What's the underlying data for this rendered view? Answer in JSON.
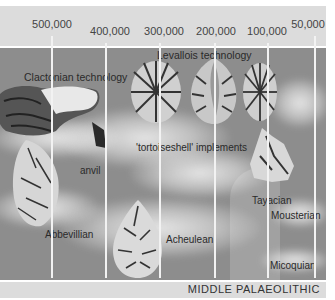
{
  "timeline": {
    "ticks": [
      {
        "label": "500,000",
        "x": 52
      },
      {
        "label": "400,000",
        "x": 106
      },
      {
        "label": "300,000",
        "x": 160
      },
      {
        "label": "200,000",
        "x": 215
      },
      {
        "label": "100,000",
        "x": 268
      },
      {
        "label": "50,000",
        "x": 315
      }
    ],
    "unit": "years ago"
  },
  "labels": {
    "clactonian": "Clactonian technology",
    "levallois": "Levallois technology",
    "tortoiseshell": "'tortoiseshell' implements",
    "anvil": "anvil",
    "abbevillian": "Abbevillian",
    "acheulean": "Acheulean",
    "tayacian": "Tayacian",
    "mousterian": "Mousterian",
    "micoquian": "Micoquian"
  },
  "footer": {
    "period": "MIDDLE PALAEOLITHIC"
  },
  "colors": {
    "header_band": "#dcdcdc",
    "main_background": "#8d8d8d",
    "gridline": "#f2f2f2",
    "text": "#333333"
  }
}
